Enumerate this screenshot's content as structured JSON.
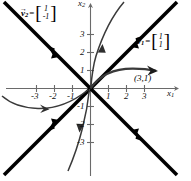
{
  "figure": {
    "type": "phase-portrait",
    "background": "#ffffff"
  },
  "axes": {
    "x_label": "x",
    "x_sub": "1",
    "y_label": "x",
    "y_sub": "2",
    "x_ticks": [
      "-3",
      "-2",
      "-1",
      "1",
      "2",
      "3"
    ],
    "y_ticks": [
      "3",
      "2",
      "1",
      "-1",
      "-2",
      "-3"
    ],
    "xlim": [
      -3.8,
      3.8
    ],
    "ylim": [
      -3.8,
      3.8
    ],
    "axis_color": "#555555"
  },
  "eigenvectors": [
    {
      "name": "v1",
      "symbol": "v",
      "sub": "1",
      "eq": "=",
      "components": [
        "1",
        "1"
      ],
      "slope": 1,
      "direction": "inward",
      "color": "#000000"
    },
    {
      "name": "v2",
      "symbol": "v",
      "sub": "2",
      "eq": "=",
      "components": [
        "1",
        "-1"
      ],
      "slope": -1,
      "direction": "inward",
      "color": "#000000"
    }
  ],
  "point": {
    "label": "(3,1)",
    "x": 3,
    "y": 1
  },
  "trajectories": {
    "color": "#3a3a3a",
    "count": 4
  },
  "colors": {
    "curve": "#3a3a3a",
    "eigenline": "#000000",
    "axis": "#6a6a6a",
    "text": "#000000"
  }
}
